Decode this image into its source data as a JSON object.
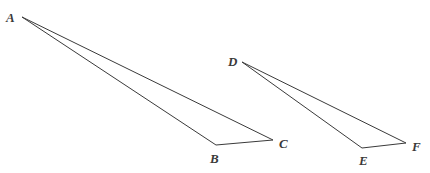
{
  "diagram": {
    "type": "geometry",
    "stroke_color": "#3a3a3a",
    "background": "#ffffff",
    "triangles": [
      {
        "name": "ABC",
        "vertices": [
          {
            "label": "A",
            "x": 22,
            "y": 17,
            "label_x": 6,
            "label_y": 22
          },
          {
            "label": "B",
            "x": 216,
            "y": 145,
            "label_x": 210,
            "label_y": 163
          },
          {
            "label": "C",
            "x": 273,
            "y": 140,
            "label_x": 279,
            "label_y": 148
          }
        ]
      },
      {
        "name": "DEF",
        "vertices": [
          {
            "label": "D",
            "x": 242,
            "y": 62,
            "label_x": 228,
            "label_y": 66
          },
          {
            "label": "E",
            "x": 362,
            "y": 148,
            "label_x": 359,
            "label_y": 165
          },
          {
            "label": "F",
            "x": 406,
            "y": 143,
            "label_x": 412,
            "label_y": 151
          }
        ]
      }
    ]
  }
}
